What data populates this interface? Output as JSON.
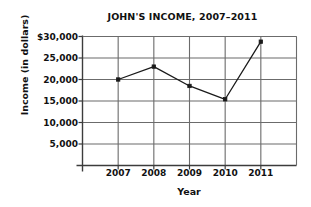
{
  "chart_data": {
    "type": "line",
    "title": "JOHN'S INCOME, 2007–2011",
    "xlabel": "Year",
    "ylabel": "Income (in dollars)",
    "categories": [
      "2007",
      "2008",
      "2009",
      "2010",
      "2011"
    ],
    "values": [
      20000,
      23000,
      18500,
      15400,
      28800
    ],
    "series": [
      {
        "name": "Income",
        "values": [
          20000,
          23000,
          18500,
          15400,
          28800
        ]
      }
    ],
    "ylim": [
      0,
      30000
    ],
    "ytick_values": [
      30000,
      25000,
      20000,
      15000,
      10000,
      5000
    ],
    "ytick_labels": [
      "$30,000",
      "25,000",
      "20,000",
      "15,000",
      "10,000",
      "5,000"
    ],
    "grid": true,
    "legend": "none",
    "line_color": "#1a1a1a",
    "marker_color": "#1a1a1a",
    "grid_color": "#6b6b6b",
    "axis_color": "#3c3c3c",
    "background": "#ffffff"
  }
}
